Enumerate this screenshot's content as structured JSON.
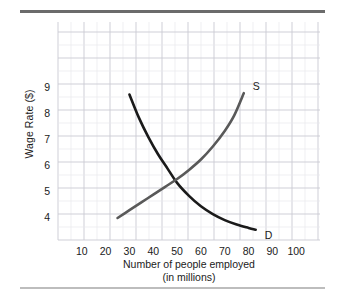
{
  "figure": {
    "top_rule_color": "#6b6b6b",
    "bottom_rule_color": "#bdbdbd"
  },
  "chart_data": {
    "type": "line",
    "title": "",
    "subtitle": "",
    "xlabel": "Number of people employed",
    "xlabel_line2": "(in millions)",
    "ylabel": "Wage Rate ($)",
    "xlim": [
      0,
      110
    ],
    "ylim": [
      3,
      10.5
    ],
    "xticks": [
      10,
      20,
      30,
      40,
      50,
      60,
      70,
      80,
      90,
      100
    ],
    "xtick_labels": [
      "10",
      "20",
      "30",
      "40",
      "50",
      "60",
      "70",
      "80",
      "90",
      "100"
    ],
    "yticks": [
      4,
      5,
      6,
      7,
      8,
      9
    ],
    "ytick_labels": [
      "4",
      "5",
      "6",
      "7",
      "8",
      "9"
    ],
    "grid": true,
    "grid_minor_color": "#e8e8ec",
    "grid_major_color": "#c9c9d2",
    "legend_position": "inline-end-labels",
    "equilibrium": {
      "quantity": 49,
      "wage": 5.4
    },
    "series": [
      {
        "name": "D",
        "label": "D",
        "label_position": "end",
        "color": "#1a1a1a",
        "width": 2.6,
        "points": [
          {
            "x": 30,
            "y": 8.75
          },
          {
            "x": 34,
            "y": 7.85
          },
          {
            "x": 38,
            "y": 7.1
          },
          {
            "x": 42,
            "y": 6.45
          },
          {
            "x": 46,
            "y": 5.9
          },
          {
            "x": 50,
            "y": 5.35
          },
          {
            "x": 55,
            "y": 4.85
          },
          {
            "x": 60,
            "y": 4.45
          },
          {
            "x": 65,
            "y": 4.15
          },
          {
            "x": 70,
            "y": 3.92
          },
          {
            "x": 75,
            "y": 3.75
          },
          {
            "x": 80,
            "y": 3.62
          },
          {
            "x": 83,
            "y": 3.55
          }
        ]
      },
      {
        "name": "S",
        "label": "S",
        "label_position": "end",
        "color": "#595959",
        "width": 2.6,
        "points": [
          {
            "x": 25,
            "y": 4.0
          },
          {
            "x": 30,
            "y": 4.3
          },
          {
            "x": 35,
            "y": 4.6
          },
          {
            "x": 40,
            "y": 4.9
          },
          {
            "x": 45,
            "y": 5.2
          },
          {
            "x": 50,
            "y": 5.5
          },
          {
            "x": 55,
            "y": 5.85
          },
          {
            "x": 60,
            "y": 6.25
          },
          {
            "x": 65,
            "y": 6.75
          },
          {
            "x": 70,
            "y": 7.35
          },
          {
            "x": 74,
            "y": 7.95
          },
          {
            "x": 78,
            "y": 8.8
          }
        ]
      }
    ]
  }
}
